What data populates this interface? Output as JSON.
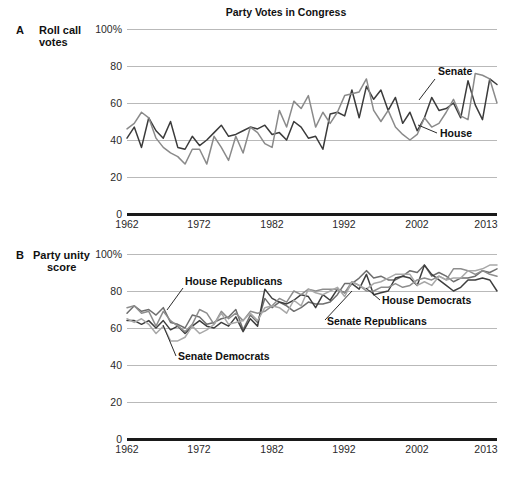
{
  "figure": {
    "title": "Party Votes in Congress",
    "width": 511,
    "height": 481
  },
  "panels": [
    {
      "letter": "A",
      "caption_line1": "Roll call",
      "caption_line2": "votes"
    },
    {
      "letter": "B",
      "caption_line1": "Party unity",
      "caption_line2": "score"
    }
  ],
  "axis": {
    "ytick_labels": [
      "100%",
      "80",
      "60",
      "40",
      "20",
      "0"
    ],
    "ytick_values": [
      100,
      80,
      60,
      40,
      20,
      0
    ],
    "xtick_labels": [
      "1962",
      "1972",
      "1982",
      "1992",
      "2002",
      "2013"
    ],
    "xtick_values": [
      1962,
      1972,
      1982,
      1992,
      2002,
      2013
    ]
  },
  "colors": {
    "dark": "#3b3b3b",
    "mid_dark": "#565656",
    "gray": "#8a8a8a",
    "light_gray": "#9e9e9e",
    "grid": "#b9b9b9",
    "axis": "#1a1a1a",
    "text": "#111111"
  },
  "annotations": {
    "panel_a": [
      {
        "text": "Senate",
        "x": 438,
        "y": 73
      },
      {
        "text": "House",
        "x": 440,
        "y": 136
      }
    ],
    "panel_b": [
      {
        "text": "House Republicans",
        "x": 185,
        "y": 283
      },
      {
        "text": "Senate Democrats",
        "x": 178,
        "y": 360
      },
      {
        "text": "House Democrats",
        "x": 382,
        "y": 303
      },
      {
        "text": "Senate Republicans",
        "x": 327,
        "y": 324
      }
    ]
  },
  "chart_data": [
    {
      "type": "line",
      "panel": "A",
      "title": "Party Votes in Congress",
      "subtitle": "Roll call votes",
      "xlabel": "",
      "ylabel": "Roll call votes",
      "ylim": [
        0,
        100
      ],
      "xlim": [
        1962,
        2013
      ],
      "grid": true,
      "legend": "inline-annotation",
      "x": [
        1962,
        1963,
        1964,
        1965,
        1966,
        1967,
        1968,
        1969,
        1970,
        1971,
        1972,
        1973,
        1974,
        1975,
        1976,
        1977,
        1978,
        1979,
        1980,
        1981,
        1982,
        1983,
        1984,
        1985,
        1986,
        1987,
        1988,
        1989,
        1990,
        1991,
        1992,
        1993,
        1994,
        1995,
        1996,
        1997,
        1998,
        1999,
        2000,
        2001,
        2002,
        2003,
        2004,
        2005,
        2006,
        2007,
        2008,
        2009,
        2010,
        2011,
        2012,
        2013
      ],
      "series": [
        {
          "name": "Senate",
          "color": "#3b3b3b",
          "values": [
            41,
            47,
            36,
            52,
            45,
            41,
            50,
            36,
            35,
            42,
            37,
            40,
            44,
            48,
            42,
            43,
            45,
            47,
            46,
            48,
            43,
            44,
            40,
            50,
            47,
            41,
            42,
            35,
            54,
            55,
            53,
            67,
            52,
            69,
            62,
            67,
            56,
            63,
            49,
            55,
            45,
            52,
            63,
            56,
            57,
            60,
            52,
            72,
            59,
            51,
            73,
            70
          ]
        },
        {
          "name": "House",
          "color": "#8a8a8a",
          "values": [
            46,
            49,
            55,
            52,
            41,
            36,
            33,
            31,
            27,
            35,
            35,
            27,
            42,
            36,
            29,
            42,
            33,
            47,
            44,
            38,
            36,
            56,
            47,
            61,
            57,
            64,
            47,
            55,
            49,
            55,
            64,
            65,
            66,
            73,
            56,
            50,
            56,
            47,
            43,
            40,
            43,
            52,
            47,
            49,
            55,
            62,
            53,
            51,
            76,
            75,
            73,
            60
          ]
        }
      ]
    },
    {
      "type": "line",
      "panel": "B",
      "title": "",
      "subtitle": "Party unity score",
      "xlabel": "",
      "ylabel": "Party unity score",
      "ylim": [
        0,
        100
      ],
      "xlim": [
        1962,
        2013
      ],
      "grid": true,
      "legend": "inline-annotation",
      "x": [
        1962,
        1963,
        1964,
        1965,
        1966,
        1967,
        1968,
        1969,
        1970,
        1971,
        1972,
        1973,
        1974,
        1975,
        1976,
        1977,
        1978,
        1979,
        1980,
        1981,
        1982,
        1983,
        1984,
        1985,
        1986,
        1987,
        1988,
        1989,
        1990,
        1991,
        1992,
        1993,
        1994,
        1995,
        1996,
        1997,
        1998,
        1999,
        2000,
        2001,
        2002,
        2003,
        2004,
        2005,
        2006,
        2007,
        2008,
        2009,
        2010,
        2011,
        2012,
        2013
      ],
      "series": [
        {
          "name": "House Republicans",
          "color": "#6e6e6e",
          "values": [
            68,
            72,
            69,
            70,
            67,
            71,
            63,
            62,
            60,
            67,
            66,
            62,
            63,
            65,
            66,
            70,
            59,
            67,
            63,
            76,
            71,
            74,
            72,
            69,
            71,
            74,
            73,
            73,
            74,
            78,
            84,
            84,
            87,
            91,
            87,
            88,
            86,
            86,
            88,
            91,
            90,
            94,
            88,
            90,
            88,
            85,
            87,
            87,
            88,
            91,
            90,
            92
          ]
        },
        {
          "name": "Senate Republicans",
          "color": "#3e3e3e",
          "values": [
            64,
            64,
            62,
            64,
            60,
            64,
            59,
            61,
            57,
            61,
            64,
            61,
            60,
            63,
            61,
            66,
            58,
            65,
            61,
            81,
            76,
            74,
            73,
            75,
            78,
            77,
            71,
            78,
            75,
            81,
            79,
            84,
            81,
            89,
            78,
            79,
            80,
            87,
            88,
            87,
            83,
            94,
            89,
            86,
            83,
            80,
            82,
            86,
            86,
            87,
            86,
            80
          ]
        },
        {
          "name": "House Democrats",
          "color": "#8d8d8d",
          "values": [
            71,
            72,
            68,
            69,
            61,
            69,
            64,
            61,
            58,
            62,
            70,
            68,
            62,
            69,
            65,
            68,
            64,
            69,
            68,
            69,
            72,
            76,
            74,
            80,
            78,
            81,
            80,
            81,
            81,
            81,
            79,
            85,
            83,
            80,
            80,
            82,
            82,
            84,
            82,
            83,
            86,
            87,
            86,
            88,
            86,
            92,
            92,
            91,
            89,
            91,
            89,
            88
          ]
        },
        {
          "name": "Senate Democrats",
          "color": "#a8a8a8",
          "values": [
            65,
            63,
            65,
            62,
            57,
            61,
            53,
            53,
            55,
            61,
            57,
            59,
            62,
            68,
            62,
            63,
            64,
            68,
            64,
            71,
            72,
            71,
            68,
            75,
            72,
            81,
            79,
            78,
            80,
            82,
            77,
            85,
            83,
            81,
            84,
            85,
            87,
            89,
            89,
            89,
            83,
            85,
            83,
            88,
            86,
            87,
            87,
            91,
            91,
            92,
            94,
            94
          ]
        }
      ]
    }
  ]
}
